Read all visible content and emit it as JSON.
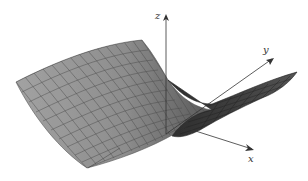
{
  "figure": {
    "type": "3d-surface-plot",
    "surface_color": "#9a9a9a",
    "mesh_line_color": "#4a4a4a",
    "dark_region_color": "#3c3c3c",
    "axis_color": "#333333"
  },
  "axes": {
    "x": {
      "label": "x"
    },
    "y": {
      "label": "y"
    },
    "z": {
      "label": "z"
    }
  }
}
